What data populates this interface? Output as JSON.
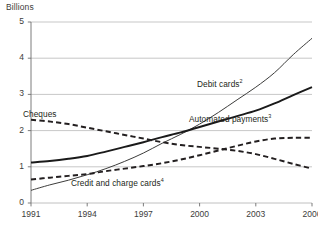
{
  "chart_data": {
    "type": "line",
    "title": "",
    "ylabel": "Billions",
    "xlabel": "",
    "ylim": [
      0,
      5
    ],
    "xlim": [
      1991,
      2006
    ],
    "yticks": [
      "0",
      "1",
      "2",
      "3",
      "4",
      "5"
    ],
    "xticks": [
      "1991",
      "1994",
      "1997",
      "2000",
      "2003",
      "2006"
    ],
    "grid": "horizontal",
    "legend_position": "inline-annotations",
    "x": [
      1991,
      1992,
      1993,
      1994,
      1995,
      1996,
      1997,
      1998,
      1999,
      2000,
      2001,
      2002,
      2003,
      2004,
      2005,
      2006
    ],
    "series": [
      {
        "name": "Debit cards",
        "footnote": "2",
        "label": "Debit cards",
        "style": "thin-solid",
        "color": "#3c3c3b",
        "values": [
          0.35,
          0.5,
          0.63,
          0.78,
          0.95,
          1.15,
          1.38,
          1.65,
          1.9,
          2.18,
          2.5,
          2.85,
          3.2,
          3.6,
          4.1,
          4.55
        ]
      },
      {
        "name": "Automated payments",
        "footnote": "3",
        "label": "Automated payments",
        "style": "thick-solid",
        "color": "#1a1a1a",
        "values": [
          1.12,
          1.16,
          1.22,
          1.3,
          1.42,
          1.55,
          1.68,
          1.82,
          1.95,
          2.1,
          2.25,
          2.4,
          2.55,
          2.75,
          2.98,
          3.2
        ]
      },
      {
        "name": "Cheques",
        "footnote": "",
        "label": "Cheques",
        "style": "bold-dashed",
        "color": "#231f20",
        "values": [
          2.3,
          2.25,
          2.18,
          2.08,
          1.98,
          1.88,
          1.78,
          1.68,
          1.6,
          1.55,
          1.5,
          1.44,
          1.35,
          1.22,
          1.08,
          0.95
        ]
      },
      {
        "name": "Credit and charge cards",
        "footnote": "4",
        "label": "Credit and charge cards",
        "style": "bold-dashed",
        "color": "#231f20",
        "values": [
          0.65,
          0.7,
          0.75,
          0.8,
          0.88,
          0.95,
          1.02,
          1.1,
          1.2,
          1.32,
          1.45,
          1.58,
          1.7,
          1.78,
          1.8,
          1.8
        ]
      }
    ],
    "annotations": [
      {
        "text": "Debit cards",
        "footnote": "2",
        "x": 2001.1,
        "y": 3.25
      },
      {
        "text": "Automated payments",
        "footnote": "3",
        "x": 2001.6,
        "y": 2.28
      },
      {
        "text": "Cheques",
        "footnote": "",
        "x": 1991.5,
        "y": 2.42
      },
      {
        "text": "Credit and charge cards",
        "footnote": "4",
        "x": 1995.6,
        "y": 0.52
      }
    ]
  }
}
